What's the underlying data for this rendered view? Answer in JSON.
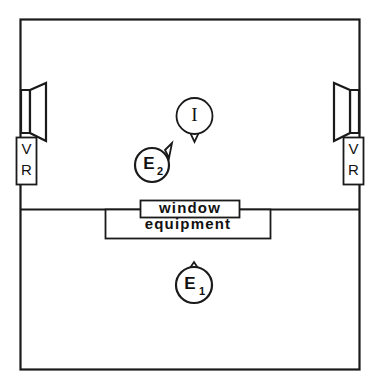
{
  "diagram": {
    "type": "acoustic-test-room-layout",
    "title": "",
    "colors": {
      "stroke": "#1a1a1a",
      "fill": "#ffffff",
      "text": "#111111",
      "background": "#ffffff"
    },
    "room": {
      "outer_wall_name": "room-outline",
      "partition_wall_name": "partition-wall"
    },
    "loudspeakers": [
      {
        "id": "left",
        "name": "loudspeaker-left",
        "orientation": "facing-right"
      },
      {
        "id": "right",
        "name": "loudspeaker-right",
        "orientation": "facing-left"
      }
    ],
    "vr_boxes": [
      {
        "id": "left",
        "name": "vr-box-left",
        "line1": "V",
        "line2": "R"
      },
      {
        "id": "right",
        "name": "vr-box-right",
        "line1": "V",
        "line2": "R"
      }
    ],
    "labeled_boxes": [
      {
        "id": "window",
        "name": "window-box",
        "label": "window"
      },
      {
        "id": "equipment",
        "name": "equipment-box",
        "label": "equipment"
      }
    ],
    "markers": [
      {
        "id": "I",
        "name": "marker-listener",
        "main": "I",
        "sub": "",
        "pointer": "down",
        "style": "serif"
      },
      {
        "id": "E2",
        "name": "marker-examiner-2",
        "main": "E",
        "sub": "2",
        "pointer": "upper-right",
        "style": "bold"
      },
      {
        "id": "E1",
        "name": "marker-examiner-1",
        "main": "E",
        "sub": "1",
        "pointer": "up",
        "style": "bold"
      }
    ]
  }
}
